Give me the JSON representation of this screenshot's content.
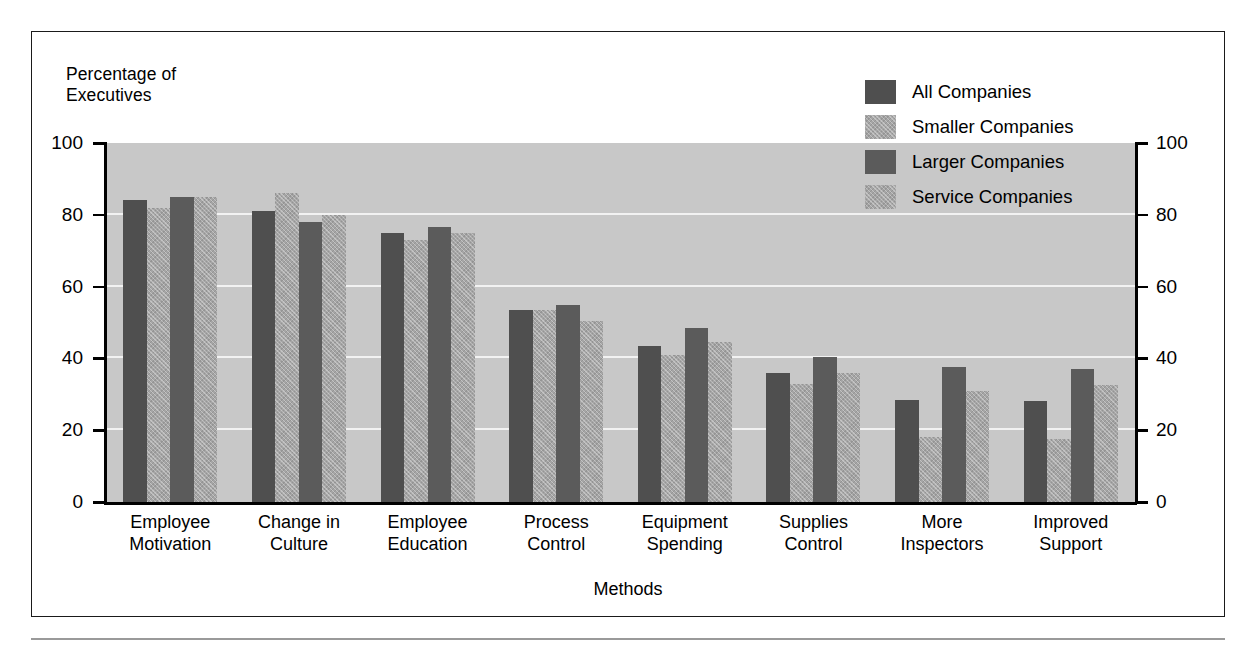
{
  "figure": {
    "y_axis_title": "Percentage of\nExecutives",
    "x_axis_title": "Methods"
  },
  "chart_data": {
    "type": "bar",
    "title": "",
    "subtitle": "",
    "xlabel": "Methods",
    "ylabel": "Percentage of Executives",
    "ylim": [
      0,
      100
    ],
    "yticks": [
      0,
      20,
      40,
      60,
      80,
      100
    ],
    "ytick_labels": [
      "0",
      "20",
      "40",
      "60",
      "80",
      "100"
    ],
    "grid": true,
    "grid_axis": "y",
    "legend_position": "top-right",
    "dual_y_axis": true,
    "categories": [
      "Employee\nMotivation",
      "Change in\nCulture",
      "Employee\nEducation",
      "Process\nControl",
      "Equipment\nSpending",
      "Supplies\nControl",
      "More\nInspectors",
      "Improved\nSupport"
    ],
    "series": [
      {
        "name": "All Companies",
        "color": "#4f4f4f",
        "pattern": "solid",
        "values": [
          84,
          81,
          75,
          53.5,
          43.5,
          36,
          28.5,
          28
        ]
      },
      {
        "name": "Smaller Companies",
        "color": "#a5a5a5",
        "pattern": "hatched",
        "values": [
          82,
          86,
          73,
          53.5,
          41,
          33,
          18,
          17.5
        ]
      },
      {
        "name": "Larger Companies",
        "color": "#5b5b5b",
        "pattern": "solid",
        "values": [
          85,
          78,
          76.5,
          55,
          48.5,
          40.5,
          37.5,
          37
        ]
      },
      {
        "name": "Service Companies",
        "color": "#a5a5a5",
        "pattern": "hatched",
        "values": [
          85,
          80,
          75,
          50.5,
          44.5,
          36,
          31,
          32.5
        ]
      }
    ]
  },
  "colors": {
    "plot_background": "#c8c8c8",
    "gridline": "#f2f2f2",
    "axis": "#000000",
    "page_background": "#ffffff",
    "frame_border": "#1a1a1a",
    "footer_rule": "#9a9a9a"
  }
}
